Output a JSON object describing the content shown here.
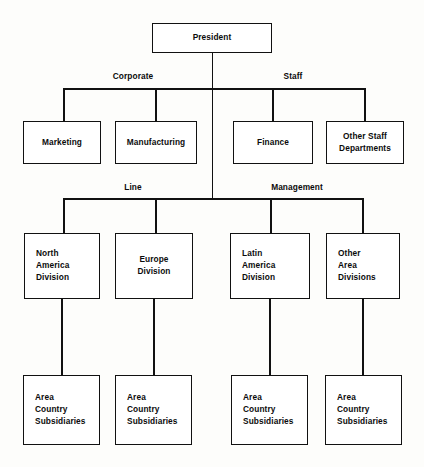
{
  "diagram": {
    "type": "org-chart",
    "orientation": "top-down",
    "line_color": "#111111",
    "box_fill": "#ffffff",
    "background": "#fdfdfb"
  },
  "tier_labels": {
    "corporate": "Corporate",
    "staff": "Staff",
    "line": "Line",
    "management": "Management"
  },
  "nodes": {
    "president": "President",
    "marketing": "Marketing",
    "manufacturing": "Manufacturing",
    "finance": "Finance",
    "other_staff_departments": "Other Staff\nDepartments",
    "north_america_division": "North\nAmerica\nDivision",
    "europe_division": "Europe\nDivision",
    "latin_america_division": "Latin\nAmerica\nDivision",
    "other_area_divisions": "Other\nArea\nDivisions",
    "subsidiaries_north_america": "Area\nCountry\nSubsidiaries",
    "subsidiaries_europe": "Area\nCountry\nSubsidiaries",
    "subsidiaries_latin_america": "Area\nCountry\nSubsidiaries",
    "subsidiaries_other_areas": "Area\nCountry\nSubsidiaries"
  }
}
